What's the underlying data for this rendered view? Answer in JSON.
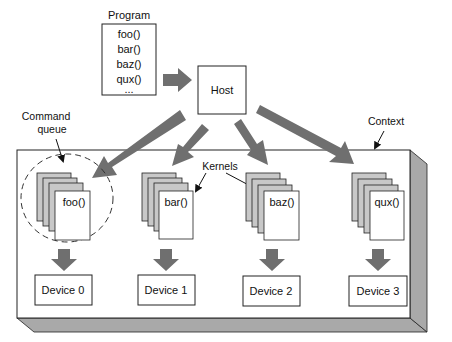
{
  "program": {
    "title": "Program",
    "functions": [
      "foo()",
      "bar()",
      "baz()",
      "qux()",
      "..."
    ]
  },
  "host": {
    "label": "Host"
  },
  "annotations": {
    "command_queue_line1": "Command",
    "command_queue_line2": "queue",
    "context": "Context",
    "kernels": "Kernels"
  },
  "kernels": [
    "foo()",
    "bar()",
    "baz()",
    "qux()"
  ],
  "devices": [
    "Device 0",
    "Device 1",
    "Device 2",
    "Device 3"
  ],
  "colors": {
    "arrow_fill": "#6f6f6f",
    "page_stack_fill": "#c8c8c8",
    "context_shadow": "#a9a9a9",
    "stroke": "#222222"
  }
}
